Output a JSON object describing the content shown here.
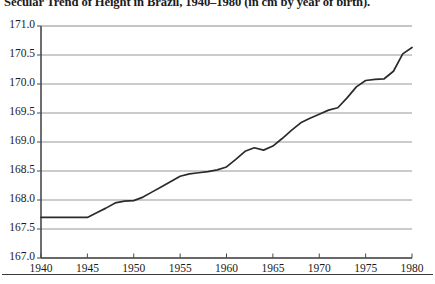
{
  "chart_data": {
    "type": "line",
    "title": "Secular Trend of Height in Brazil, 1940–1980 (in cm by year of birth).",
    "xlabel": "",
    "ylabel": "",
    "xlim": [
      1940,
      1980
    ],
    "ylim": [
      167.0,
      171.0
    ],
    "grid": true,
    "legend": null,
    "x_tick_labels": [
      "1940",
      "1945",
      "1950",
      "1955",
      "1960",
      "1965",
      "1970",
      "1975",
      "1980"
    ],
    "x_ticks": [
      1940,
      1945,
      1950,
      1955,
      1960,
      1965,
      1970,
      1975,
      1980
    ],
    "y_tick_labels": [
      "167.0",
      "167.5",
      "168.0",
      "168.5",
      "169.0",
      "169.5",
      "170.0",
      "170.5",
      "171.0"
    ],
    "y_ticks": [
      167.0,
      167.5,
      168.0,
      168.5,
      169.0,
      169.5,
      170.0,
      170.5,
      171.0
    ],
    "series": [
      {
        "name": "Mean height (cm)",
        "x": [
          1940,
          1941,
          1942,
          1943,
          1944,
          1945,
          1946,
          1947,
          1948,
          1949,
          1950,
          1951,
          1952,
          1953,
          1954,
          1955,
          1956,
          1957,
          1958,
          1959,
          1960,
          1961,
          1962,
          1963,
          1964,
          1965,
          1966,
          1967,
          1968,
          1969,
          1970,
          1971,
          1972,
          1973,
          1974,
          1975,
          1976,
          1977,
          1978,
          1979,
          1980
        ],
        "values": [
          167.7,
          167.7,
          167.7,
          167.7,
          167.7,
          167.7,
          167.78,
          167.86,
          167.95,
          167.98,
          167.99,
          168.05,
          168.14,
          168.23,
          168.32,
          168.41,
          168.45,
          168.47,
          168.49,
          168.52,
          168.57,
          168.7,
          168.84,
          168.9,
          168.86,
          168.93,
          169.06,
          169.2,
          169.33,
          169.41,
          169.48,
          169.55,
          169.59,
          169.76,
          169.95,
          170.06,
          170.08,
          170.09,
          170.22,
          170.52,
          170.63
        ]
      }
    ]
  },
  "figure": {
    "background_color": "#ffffff",
    "line_color": "#2b2b2b",
    "grid_color": "#8c8c8c",
    "axis_color": "#4a4a4a",
    "text_color": "#1b1b1b"
  }
}
